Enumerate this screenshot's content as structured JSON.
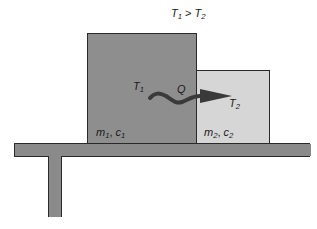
{
  "diagram": {
    "condition": {
      "lhs_sym": "T",
      "lhs_sub": "1",
      "op": ">",
      "rhs_sym": "T",
      "rhs_sub": "2"
    },
    "block1": {
      "temp_sym": "T",
      "temp_sub": "1",
      "mass_sym": "m",
      "mass_sub": "1",
      "sep": ",",
      "heat_sym": "c",
      "heat_sub": "1",
      "color": "#8e8e8e"
    },
    "block2": {
      "temp_sym": "T",
      "temp_sub": "2",
      "mass_sym": "m",
      "mass_sub": "2",
      "sep": ",",
      "heat_sym": "c",
      "heat_sub": "2",
      "color": "#d6d6d6"
    },
    "heat_flow": {
      "label": "Q",
      "direction": "block1-to-block2",
      "arrow_color": "#3a3a3a"
    },
    "table": {
      "color": "#8a8a8a"
    }
  }
}
